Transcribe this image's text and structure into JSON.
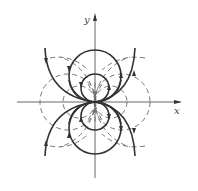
{
  "diagram": {
    "type": "dipole field lines",
    "axes": {
      "x_label": "x",
      "y_label": "y"
    },
    "origin": [
      95,
      102
    ],
    "solid_curves": {
      "description": "field lines (circles tangent to x-axis at origin)",
      "circle_radii": [
        14,
        26
      ],
      "open_arcs": "outermost field lines drawn as open arcs"
    },
    "dashed_curves": {
      "description": "equipotential lines (circles tangent to y-axis at origin)",
      "circle_radii": [
        16,
        28,
        50
      ]
    },
    "colors": {
      "solid": "#333333",
      "dashed": "#666666",
      "axis": "#555555"
    }
  }
}
